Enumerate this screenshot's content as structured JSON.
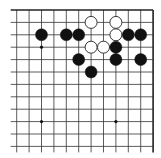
{
  "diagram": {
    "type": "go-board-fragment",
    "orientation": "top-right corner",
    "columns": 12,
    "rows": 12,
    "grid": {
      "x0": 16.7,
      "y0": 10,
      "spacing_x": 12.4,
      "spacing_y": 12.4,
      "line_color": "#333333",
      "edge_color": "#222222",
      "edges": [
        "top",
        "right"
      ]
    },
    "star_points": [
      {
        "col": 2,
        "row": 3
      },
      {
        "col": 2,
        "row": 9
      },
      {
        "col": 8,
        "row": 9
      }
    ],
    "stones": [
      {
        "color": "black",
        "col": 2,
        "row": 2
      },
      {
        "color": "black",
        "col": 4,
        "row": 2
      },
      {
        "color": "black",
        "col": 5,
        "row": 2
      },
      {
        "color": "white",
        "col": 6,
        "row": 1
      },
      {
        "color": "white",
        "col": 8,
        "row": 1
      },
      {
        "color": "white",
        "col": 8,
        "row": 2
      },
      {
        "color": "black",
        "col": 9,
        "row": 2
      },
      {
        "color": "black",
        "col": 10,
        "row": 2
      },
      {
        "color": "white",
        "col": 6,
        "row": 3
      },
      {
        "color": "white",
        "col": 7,
        "row": 3
      },
      {
        "color": "black",
        "col": 8,
        "row": 3
      },
      {
        "color": "black",
        "col": 5,
        "row": 4
      },
      {
        "color": "black",
        "col": 8,
        "row": 4
      },
      {
        "color": "black",
        "col": 10,
        "row": 4
      },
      {
        "color": "black",
        "col": 6,
        "row": 5
      }
    ],
    "colors": {
      "black_stone": "#111111",
      "white_stone_fill": "#ffffff",
      "white_stone_stroke": "#222222",
      "background": "#ffffff"
    }
  }
}
